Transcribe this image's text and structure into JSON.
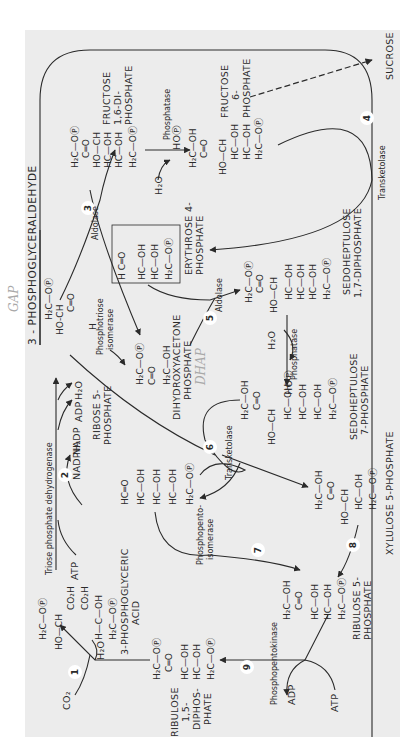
{
  "figure": {
    "background": "#ececec",
    "page_background": "#ffffff",
    "ink": "#2a2a2a",
    "annotation_color": "#a8a8a8"
  },
  "compounds": {
    "gap": "3 - PHOSPHOGLYCERALDEHYDE",
    "fdp_1": "FRUCTOSE",
    "fdp_2": "1,6-DI-",
    "fdp_3": "PHOSPHATE",
    "f6p_1": "FRUCTOSE",
    "f6p_2": "6-",
    "f6p_3": "PHOSPHATE",
    "sucrose": "SUCROSE",
    "e4p_1": "ERYTHROSE 4-",
    "e4p_2": "PHOSPHATE",
    "dhap_1": "DIHYDROXYACETONE",
    "dhap_2": "PHOSPHATE",
    "sdp_1": "SEDOHEPTULOSE",
    "sdp_2": "1,7-DIPHOSPHATE",
    "s7p_1": "SEDOHEPTULOSE",
    "s7p_2": "7-PHOSPHATE",
    "r5p_a_1": "RIBOSE 5-",
    "r5p_a_2": "PHOSPHATE",
    "x5p": "XYLULOSE 5-PHOSPHATE",
    "pga_1": "3-PHOSPHOGLYCERIC",
    "pga_2": "ACID",
    "rudp_1": "RIBULOSE",
    "rudp_2": "1,5-",
    "rudp_3": "DIPHOS-",
    "rudp_4": "PHATE",
    "ru5p_1": "RIBULOSE 5-",
    "ru5p_2": "PHOSPHATE"
  },
  "enzymes": {
    "triose_dh": "Triose phosphate dehydrogenase",
    "aldolase_3": "Aldolase",
    "aldolase_5": "Aldolase",
    "phosphatase_fdp": "Phosphatase",
    "phosphatase_sdp": "Phosphatase",
    "isomerase_1": "Phosphotriose",
    "isomerase_2": "isomerase",
    "transketolase_4": "Transketolase",
    "transketolase_6": "Transketolase",
    "ppi_1": "Phosphopento-",
    "ppi_2": "isomerase",
    "ppk": "Phosphopentokinase"
  },
  "cofactors": {
    "atp_2": "ATP",
    "nadph": "NADPH₂",
    "nadp": "NADP",
    "adp_2": "ADP",
    "h2o_2": "H₂O",
    "co2": "CO₂",
    "h2o_1": "H₂O",
    "adp_9": "ADP",
    "atp_9": "ATP",
    "h2o_fdp": "H₂O",
    "hop_fdp": "HOⓅ",
    "h2o_sdp": "H₂O",
    "hop_sdp": "HOⓅ"
  },
  "steps": [
    "1",
    "2",
    "3",
    "4",
    "5",
    "6",
    "7",
    "8",
    "9"
  ],
  "annotations": {
    "gap_hand": "GAP",
    "dhap_hand": "DHAP"
  },
  "structures": {
    "gap": [
      "H₂C—OⓅ",
      "HO-CH",
      "C═O",
      "H"
    ],
    "fdp": [
      "H₂C—OⓅ",
      "C═O",
      "HO—CH",
      "HC—OH",
      "HC—OH",
      "H₂C—OⓅ"
    ],
    "f6p": [
      "H₂C—OH",
      "C═O",
      "HO—CH",
      "HC—OH",
      "HC—OH",
      "H₂C—OⓅ"
    ],
    "e4p": [
      "H C═O",
      "HC—OH",
      "HC—OH",
      "H₂C—OⓅ"
    ],
    "dhap": [
      "H₂C—OⓅ",
      "C═O",
      "H₂C—OH"
    ],
    "sdp": [
      "H₂C—OⓅ",
      "C═O",
      "HO—CH",
      "HC—OH",
      "HC—OH",
      "HC—OH",
      "H₂C—OⓅ"
    ],
    "s7p": [
      "H₂C—OH",
      "C═O",
      "HO—CH",
      "HC—OH",
      "HC—OH",
      "HC—OH",
      "H₂C—OⓅ"
    ],
    "r5p": [
      "HC═O",
      "HC—OH",
      "HC—OH",
      "HC—OH",
      "H₂C—OⓅ"
    ],
    "x5p": [
      "H₂C—OH",
      "C═O",
      "HO—CH",
      "HC—OH",
      "H₂C—OⓅ"
    ],
    "pga": [
      "H₂C—OⓅ",
      "HO—CH",
      "CO₂H",
      "CO₂H",
      "H—C—OH",
      "H₂C—OⓅ"
    ],
    "rudp": [
      "H₂C—OⓅ",
      "C═O",
      "HC—OH",
      "HC—OH",
      "H₂C—OⓅ"
    ],
    "ru5p": [
      "H₂C—OH",
      "C═O",
      "HC—OH",
      "HC—OH",
      "H₂C—OⓅ"
    ]
  }
}
